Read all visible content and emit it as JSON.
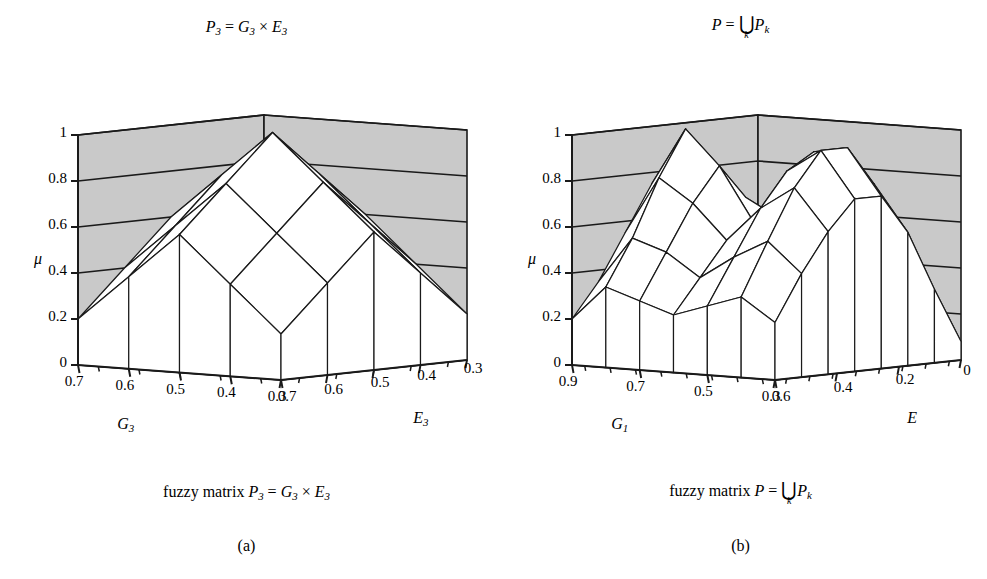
{
  "figure": {
    "width": 987,
    "height": 579,
    "background": "#ffffff",
    "wall_color": "#c9c9c9",
    "floor_color": "#8f8f8f",
    "surface_color": "#ffffff",
    "line_color": "#1a1a1a"
  },
  "panels": [
    {
      "id": "a",
      "letter": "(a)",
      "title_parts": {
        "lhs": "P",
        "lhs_sub": "3",
        "eq": "=",
        "rhs1": "G",
        "rhs1_sub": "3",
        "op": "×",
        "rhs2": "E",
        "rhs2_sub": "3"
      },
      "title_plain": "P3 = G3 × E3",
      "caption_prefix": "fuzzy matrix",
      "caption_plain": "fuzzy matrix P3 = G3 × E3",
      "zaxis": {
        "label": "μ",
        "ticks": [
          "0",
          "0.2",
          "0.4",
          "0.6",
          "0.8",
          "1"
        ],
        "values": [
          0,
          0.2,
          0.4,
          0.6,
          0.8,
          1
        ],
        "range": [
          0,
          1
        ]
      },
      "xaxis": {
        "name": "G",
        "name_sub": "3",
        "name_plain": "G3",
        "ticks": [
          "0.7",
          "0.6",
          "0.5",
          "0.4",
          "0.3"
        ],
        "values": [
          0.7,
          0.6,
          0.5,
          0.4,
          0.3
        ],
        "minor_ticks": 4
      },
      "yaxis": {
        "name": "E",
        "name_sub": "3",
        "name_plain": "E3",
        "ticks": [
          "0.7",
          "0.6",
          "0.5",
          "0.4",
          "0.3"
        ],
        "values": [
          0.7,
          0.6,
          0.5,
          0.4,
          0.3
        ],
        "minor_ticks": 4
      },
      "chart_data": {
        "type": "surface",
        "title": "P3 = G3 × E3",
        "xlabel": "G3",
        "ylabel": "E3",
        "zlabel": "μ",
        "zlim": [
          0,
          1
        ],
        "grid": true,
        "legend": "none",
        "x": [
          0.7,
          0.6,
          0.5,
          0.4,
          0.3
        ],
        "y": [
          0.7,
          0.6,
          0.5,
          0.4,
          0.3
        ],
        "z": [
          [
            0.2,
            0.4,
            0.6,
            0.4,
            0.2
          ],
          [
            0.4,
            0.6,
            0.8,
            0.6,
            0.4
          ],
          [
            0.6,
            0.8,
            1.0,
            0.8,
            0.6
          ],
          [
            0.4,
            0.6,
            0.8,
            0.6,
            0.4
          ],
          [
            0.2,
            0.4,
            0.6,
            0.4,
            0.2
          ]
        ],
        "annotation": "single pyramid peak at mu = 1 in the centre"
      }
    },
    {
      "id": "b",
      "letter": "(b)",
      "title_parts": {
        "lhs": "P",
        "eq": "=",
        "op": "⋃",
        "op_index": "k",
        "rhs": "P",
        "rhs_sub": "k"
      },
      "title_plain": "P = ⋃k Pk",
      "caption_prefix": "fuzzy matrix",
      "caption_plain": "fuzzy matrix P = ⋃k Pk",
      "zaxis": {
        "label": "μ",
        "ticks": [
          "0",
          "0.2",
          "0.4",
          "0.6",
          "0.8",
          "1"
        ],
        "values": [
          0,
          0.2,
          0.4,
          0.6,
          0.8,
          1
        ],
        "range": [
          0,
          1
        ]
      },
      "xaxis": {
        "name": "G",
        "name_sub": "1",
        "name_plain": "G1",
        "ticks": [
          "0.9",
          "0.7",
          "0.5",
          "0.3"
        ],
        "values": [
          0.9,
          0.7,
          0.5,
          0.3
        ],
        "minor_ticks": 7
      },
      "yaxis": {
        "name": "E",
        "name_sub": "",
        "name_plain": "E",
        "ticks": [
          "0.6",
          "0.4",
          "0.2",
          "0"
        ],
        "values": [
          0.6,
          0.4,
          0.2,
          0
        ],
        "minor_ticks": 7
      },
      "chart_data": {
        "type": "surface",
        "title": "P = ⋃k Pk",
        "xlabel": "G1",
        "ylabel": "E",
        "zlabel": "μ",
        "zlim": [
          0,
          1
        ],
        "grid": true,
        "legend": "none",
        "x": [
          0.9,
          0.8,
          0.7,
          0.6,
          0.5,
          0.4,
          0.3
        ],
        "y": [
          0.7,
          0.6,
          0.5,
          0.4,
          0.3,
          0.2,
          0.1,
          0.0
        ],
        "z": [
          [
            0.2,
            0.35,
            0.55,
            0.75,
            0.55,
            0.35,
            0.2,
            0.05
          ],
          [
            0.35,
            0.55,
            0.8,
            1.0,
            0.8,
            0.55,
            0.3,
            0.08
          ],
          [
            0.3,
            0.5,
            0.7,
            0.85,
            0.7,
            0.5,
            0.28,
            0.08
          ],
          [
            0.25,
            0.4,
            0.55,
            0.62,
            0.62,
            0.5,
            0.3,
            0.1
          ],
          [
            0.3,
            0.5,
            0.7,
            0.85,
            0.92,
            0.7,
            0.4,
            0.12
          ],
          [
            0.35,
            0.58,
            0.8,
            0.95,
            0.95,
            0.78,
            0.45,
            0.12
          ],
          [
            0.25,
            0.45,
            0.62,
            0.75,
            0.75,
            0.58,
            0.32,
            0.08
          ]
        ],
        "annotation": "two pyramid peaks; left peak reaches mu = 1, right plateau near mu = 0.95"
      }
    }
  ]
}
